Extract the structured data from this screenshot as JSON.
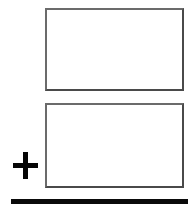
{
  "figure": {
    "type": "vertical-addition-template",
    "background_color": "#ffffff",
    "width": 195,
    "height": 217
  },
  "boxes": [
    {
      "name": "first-addend-box",
      "role": "first addend",
      "value": "",
      "border_color": "#5a5a5a",
      "fill_color": "#ffffff",
      "x": 45,
      "y": 8,
      "width": 139,
      "height": 83
    },
    {
      "name": "second-addend-box",
      "role": "second addend",
      "value": "",
      "border_color": "#5a5a5a",
      "fill_color": "#ffffff",
      "x": 45,
      "y": 103,
      "width": 139,
      "height": 85
    }
  ],
  "operator": {
    "name": "plus-icon",
    "symbol": "+",
    "color": "#050505",
    "x": 13,
    "y": 152,
    "width": 25,
    "height": 27
  },
  "sum_rule": {
    "name": "sum-line",
    "color": "#0a0a0a",
    "x": 11,
    "y": 199,
    "width": 177,
    "thickness": 5
  }
}
